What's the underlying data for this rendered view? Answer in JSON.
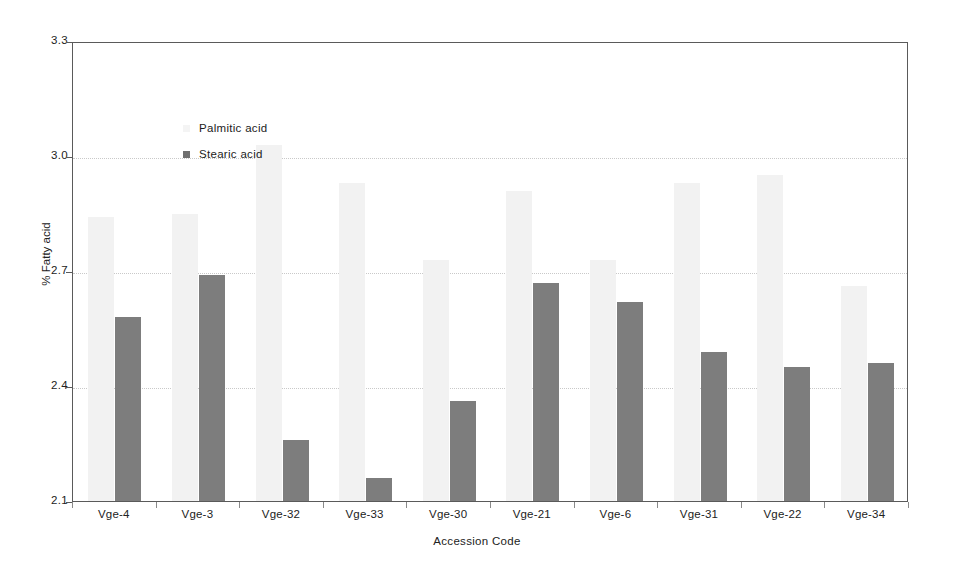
{
  "chart_data": {
    "type": "bar",
    "title": "",
    "subtitle": "",
    "xlabel": "Accession Code",
    "ylabel": "% Fatty acid",
    "ylim": [
      2.1,
      3.3
    ],
    "yticks": [
      "2.1",
      "2.4",
      "2.7",
      "3.0",
      "3.3"
    ],
    "grid": true,
    "legend_position": "inside-top-left",
    "categories": [
      "Vge-4",
      "Vge-3",
      "Vge-32",
      "Vge-33",
      "Vge-30",
      "Vge-21",
      "Vge-6",
      "Vge-31",
      "Vge-22",
      "Vge-34"
    ],
    "series": [
      {
        "name": "Palmitic acid",
        "color": "#f2f2f2",
        "values": [
          2.84,
          2.85,
          3.03,
          2.93,
          2.73,
          2.91,
          2.73,
          2.93,
          2.95,
          2.66
        ]
      },
      {
        "name": "Stearic acid",
        "color": "#7d7d7d",
        "values": [
          2.58,
          2.69,
          2.26,
          2.16,
          2.36,
          2.67,
          2.62,
          2.49,
          2.45,
          2.46
        ]
      }
    ]
  },
  "legend": {
    "items": [
      {
        "label": "Palmitic acid",
        "swatch": "palmitic"
      },
      {
        "label": "Stearic acid",
        "swatch": "stearic"
      }
    ]
  },
  "axes": {
    "y_label": "% Fatty acid",
    "x_label": "Accession Code"
  }
}
